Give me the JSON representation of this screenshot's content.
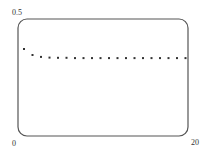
{
  "chart_data": {
    "type": "scatter",
    "title": "",
    "xlabel": "",
    "ylabel": "",
    "xlim": [
      0,
      20
    ],
    "ylim": [
      0,
      0.5
    ],
    "x_tick_labels": [
      "0",
      "20"
    ],
    "y_tick_labels": [
      "0.5"
    ],
    "grid": false,
    "legend": null,
    "series": [
      {
        "name": "sequence",
        "x": [
          1,
          2,
          3,
          4,
          5,
          6,
          7,
          8,
          9,
          10,
          11,
          12,
          13,
          14,
          15,
          16,
          17,
          18,
          19,
          20
        ],
        "values": [
          0.372,
          0.346,
          0.338,
          0.335,
          0.334,
          0.334,
          0.333,
          0.333,
          0.333,
          0.333,
          0.333,
          0.333,
          0.333,
          0.333,
          0.333,
          0.333,
          0.333,
          0.333,
          0.333,
          0.333
        ]
      }
    ]
  },
  "colors": {
    "frame": "#555555",
    "points": "#333333",
    "text": "#333333"
  },
  "labels": {
    "y_max": "0.5",
    "origin": "0",
    "x_max": "20"
  }
}
